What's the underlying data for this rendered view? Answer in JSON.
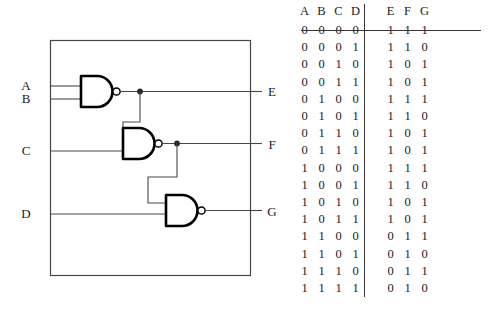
{
  "circuit": {
    "title": "nand-gate-cascade",
    "inputs": [
      {
        "label": "A",
        "x": 26,
        "y": 86
      },
      {
        "label": "B",
        "x": 26,
        "y": 99
      },
      {
        "label": "C",
        "x": 26,
        "y": 151
      },
      {
        "label": "D",
        "x": 26,
        "y": 214
      }
    ],
    "outputs": [
      {
        "label": "E",
        "x": 272,
        "y": 93
      },
      {
        "label": "F",
        "x": 272,
        "y": 146
      },
      {
        "label": "G",
        "x": 272,
        "y": 212
      }
    ],
    "gates": [
      {
        "name": "nand-gate-1",
        "output": "E",
        "in1": "A",
        "in2": "B"
      },
      {
        "name": "nand-gate-2",
        "output": "F",
        "in1": "E",
        "in2": "C"
      },
      {
        "name": "nand-gate-3",
        "output": "G",
        "in1": "F",
        "in2": "D"
      }
    ],
    "line_color": "#4a4646",
    "gate_color": "#000000"
  },
  "table": {
    "input_headers": [
      "A",
      "B",
      "C",
      "D"
    ],
    "output_headers": [
      "E",
      "F",
      "G"
    ],
    "rows": [
      {
        "inputs": [
          "0",
          "0",
          "0",
          "0"
        ],
        "outputs": [
          "1",
          "1",
          "1"
        ]
      },
      {
        "inputs": [
          "0",
          "0",
          "0",
          "1"
        ],
        "outputs": [
          "1",
          "1",
          "0"
        ]
      },
      {
        "inputs": [
          "0",
          "0",
          "1",
          "0"
        ],
        "outputs": [
          "1",
          "0",
          "1"
        ]
      },
      {
        "inputs": [
          "0",
          "0",
          "1",
          "1"
        ],
        "outputs": [
          "1",
          "0",
          "1"
        ]
      },
      {
        "inputs": [
          "0",
          "1",
          "0",
          "0"
        ],
        "outputs": [
          "1",
          "1",
          "1"
        ]
      },
      {
        "inputs": [
          "0",
          "1",
          "0",
          "1"
        ],
        "outputs": [
          "1",
          "1",
          "0"
        ]
      },
      {
        "inputs": [
          "0",
          "1",
          "1",
          "0"
        ],
        "outputs": [
          "1",
          "0",
          "1"
        ]
      },
      {
        "inputs": [
          "0",
          "1",
          "1",
          "1"
        ],
        "outputs": [
          "1",
          "0",
          "1"
        ]
      },
      {
        "inputs": [
          "1",
          "0",
          "0",
          "0"
        ],
        "outputs": [
          "1",
          "1",
          "1"
        ]
      },
      {
        "inputs": [
          "1",
          "0",
          "0",
          "1"
        ],
        "outputs": [
          "1",
          "1",
          "0"
        ]
      },
      {
        "inputs": [
          "1",
          "0",
          "1",
          "0"
        ],
        "outputs": [
          "1",
          "0",
          "1"
        ]
      },
      {
        "inputs": [
          "1",
          "0",
          "1",
          "1"
        ],
        "outputs": [
          "1",
          "0",
          "1"
        ]
      },
      {
        "inputs": [
          "1",
          "1",
          "0",
          "0"
        ],
        "outputs": [
          "0",
          "1",
          "1"
        ]
      },
      {
        "inputs": [
          "1",
          "1",
          "0",
          "1"
        ],
        "outputs": [
          "0",
          "1",
          "0"
        ]
      },
      {
        "inputs": [
          "1",
          "1",
          "1",
          "0"
        ],
        "outputs": [
          "0",
          "1",
          "1"
        ]
      },
      {
        "inputs": [
          "1",
          "1",
          "1",
          "1"
        ],
        "outputs": [
          "0",
          "1",
          "0"
        ]
      }
    ]
  }
}
